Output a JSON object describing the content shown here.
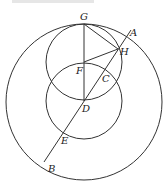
{
  "diagram": {
    "type": "geometry",
    "circles": [
      {
        "name": "outer-circle",
        "cx": 84,
        "cy": 102,
        "r": 78
      },
      {
        "name": "upper-circle",
        "cx": 84,
        "cy": 62,
        "r": 38
      },
      {
        "name": "middle-circle",
        "cx": 84,
        "cy": 101,
        "r": 38
      }
    ],
    "points": {
      "G": {
        "x": 84,
        "y": 24,
        "label": "G"
      },
      "A": {
        "x": 131,
        "y": 30,
        "label": "A"
      },
      "H": {
        "x": 118,
        "y": 49,
        "label": "H"
      },
      "F": {
        "x": 84,
        "y": 62,
        "label": "F"
      },
      "C": {
        "x": 104,
        "y": 72,
        "label": "C"
      },
      "D": {
        "x": 84,
        "y": 101,
        "label": "D"
      },
      "E": {
        "x": 64,
        "y": 130,
        "label": "E"
      },
      "B": {
        "x": 44,
        "y": 160,
        "label": "B"
      }
    },
    "segments": [
      [
        "G",
        "D"
      ],
      [
        "G",
        "H"
      ],
      [
        "F",
        "H"
      ],
      [
        "A",
        "B"
      ]
    ]
  }
}
